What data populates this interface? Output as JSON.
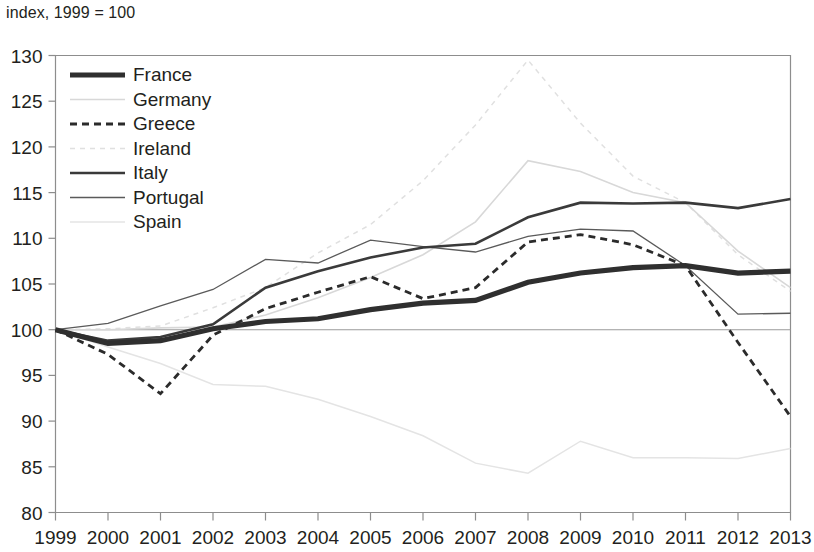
{
  "figure": {
    "axis_note": "index, 1999 = 100",
    "background": "#ffffff",
    "text_color": "#231f20",
    "frame_color": "#8d8d8d"
  },
  "legend": {
    "position": "top-left inside plot",
    "entries": [
      {
        "label": "France",
        "color": "#2f2f2f",
        "width": 5.2,
        "dash": "none"
      },
      {
        "label": "Germany",
        "color": "#d8d8d8",
        "width": 1.6,
        "dash": "none"
      },
      {
        "label": "Greece",
        "color": "#2b2b2b",
        "width": 2.8,
        "dash": "7,5"
      },
      {
        "label": "Ireland",
        "color": "#e0e0e0",
        "width": 1.5,
        "dash": "5,5"
      },
      {
        "label": "Italy",
        "color": "#3a3a3a",
        "width": 2.6,
        "dash": "none"
      },
      {
        "label": "Portugal",
        "color": "#5a5a5a",
        "width": 1.3,
        "dash": "none"
      },
      {
        "label": "Spain",
        "color": "#e4e4e4",
        "width": 1.5,
        "dash": "none"
      }
    ]
  },
  "chart_data": {
    "type": "line",
    "title": "",
    "subtitle": "",
    "xlabel": "",
    "ylabel": "index, 1999 = 100",
    "x": [
      1999,
      2000,
      2001,
      2002,
      2003,
      2004,
      2005,
      2006,
      2007,
      2008,
      2009,
      2010,
      2011,
      2012,
      2013
    ],
    "xtick_labels": [
      "1999",
      "2000",
      "2001",
      "2002",
      "2003",
      "2004",
      "2005",
      "2006",
      "2007",
      "2008",
      "2009",
      "2010",
      "2011",
      "2012",
      "2013"
    ],
    "ytick_labels": [
      "80",
      "85",
      "90",
      "95",
      "100",
      "105",
      "110",
      "115",
      "120",
      "125",
      "130"
    ],
    "yticks": [
      80,
      85,
      90,
      95,
      100,
      105,
      110,
      115,
      120,
      125,
      130
    ],
    "xlim": [
      1999,
      2013
    ],
    "ylim": [
      80,
      130
    ],
    "grid": false,
    "reference_line": 100,
    "legend_position": "upper left",
    "series": [
      {
        "name": "France",
        "values": [
          100.0,
          98.5,
          98.8,
          100.1,
          100.9,
          101.2,
          102.2,
          102.9,
          103.2,
          105.2,
          106.2,
          106.8,
          107.0,
          106.2,
          106.4
        ]
      },
      {
        "name": "Germany",
        "values": [
          100.0,
          100.0,
          100.2,
          100.3,
          101.6,
          103.5,
          105.7,
          108.2,
          111.8,
          118.5,
          117.3,
          115.0,
          113.9,
          108.6,
          104.6
        ]
      },
      {
        "name": "Greece",
        "values": [
          100.0,
          97.3,
          93.0,
          99.4,
          102.3,
          104.1,
          105.8,
          103.4,
          104.6,
          109.6,
          110.4,
          109.3,
          107.0,
          98.6,
          90.5
        ]
      },
      {
        "name": "Ireland",
        "values": [
          100.0,
          100.1,
          100.4,
          102.4,
          104.6,
          108.4,
          111.5,
          116.3,
          122.4,
          129.5,
          122.6,
          116.8,
          113.9,
          108.2,
          104.2
        ]
      },
      {
        "name": "Italy",
        "values": [
          100.0,
          98.8,
          99.2,
          100.6,
          104.6,
          106.4,
          107.9,
          109.0,
          109.4,
          112.3,
          113.9,
          113.8,
          113.9,
          113.3,
          114.3
        ]
      },
      {
        "name": "Portugal",
        "values": [
          100.0,
          100.7,
          102.6,
          104.4,
          107.7,
          107.3,
          109.8,
          109.1,
          108.5,
          110.2,
          111.0,
          110.8,
          107.0,
          101.7,
          101.8
        ]
      },
      {
        "name": "Spain",
        "values": [
          100.0,
          98.1,
          96.3,
          94.0,
          93.8,
          92.4,
          90.5,
          88.4,
          85.4,
          84.3,
          87.8,
          86.0,
          86.0,
          85.9,
          87.0
        ]
      }
    ]
  }
}
